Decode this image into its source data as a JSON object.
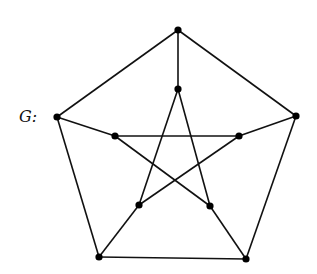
{
  "diagram": {
    "label": "G:",
    "type": "graph",
    "name": "Petersen graph",
    "nodes": [
      {
        "id": "o1",
        "x": 178,
        "y": 30
      },
      {
        "id": "o2",
        "x": 296,
        "y": 116
      },
      {
        "id": "o3",
        "x": 246,
        "y": 259
      },
      {
        "id": "o4",
        "x": 99,
        "y": 257
      },
      {
        "id": "o5",
        "x": 57,
        "y": 117
      },
      {
        "id": "i1",
        "x": 178,
        "y": 89
      },
      {
        "id": "i2",
        "x": 239,
        "y": 136
      },
      {
        "id": "i3",
        "x": 210,
        "y": 206
      },
      {
        "id": "i4",
        "x": 139,
        "y": 205
      },
      {
        "id": "i5",
        "x": 115,
        "y": 136
      }
    ],
    "edges": [
      [
        "o1",
        "o2"
      ],
      [
        "o2",
        "o3"
      ],
      [
        "o3",
        "o4"
      ],
      [
        "o4",
        "o5"
      ],
      [
        "o5",
        "o1"
      ],
      [
        "o1",
        "i1"
      ],
      [
        "o2",
        "i2"
      ],
      [
        "o3",
        "i3"
      ],
      [
        "o4",
        "i4"
      ],
      [
        "o5",
        "i5"
      ],
      [
        "i1",
        "i3"
      ],
      [
        "i3",
        "i5"
      ],
      [
        "i5",
        "i2"
      ],
      [
        "i2",
        "i4"
      ],
      [
        "i4",
        "i1"
      ]
    ],
    "colors": {
      "edge": "#111111",
      "node": "#000000"
    }
  }
}
